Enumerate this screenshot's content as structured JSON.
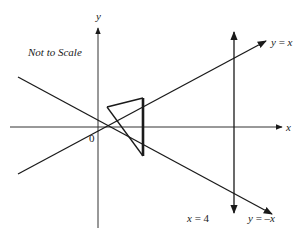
{
  "diagram": {
    "note": "Not to Scale",
    "axes": {
      "x_label": "x",
      "y_label": "y",
      "origin_label": "0"
    },
    "lines": {
      "y_eq_x": {
        "label_lhs": "y",
        "label_eq": " = ",
        "label_rhs": "x"
      },
      "y_eq_neg_x": {
        "label_lhs": "y",
        "label_eq": " = –",
        "label_rhs": "x"
      },
      "x_eq_4": {
        "label_lhs": "x",
        "label_eq": " = ",
        "label_rhs": "4"
      }
    },
    "triangle": {
      "description": "Triangle with thick vertical side between y = x and y = -x, and apex pointing left toward origin"
    },
    "colors": {
      "ink": "#1a1a1a",
      "background": "#ffffff"
    }
  }
}
